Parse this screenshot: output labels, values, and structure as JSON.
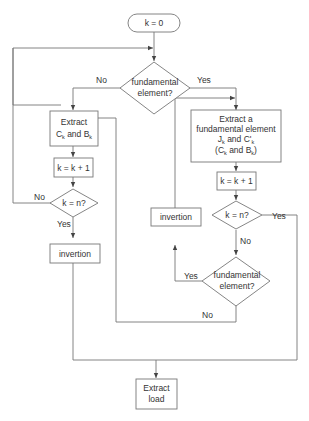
{
  "diagram": {
    "type": "flowchart",
    "nodes": {
      "start": {
        "label": "k = 0"
      },
      "decision_top": {
        "line1": "fundamental",
        "line2": "element?"
      },
      "left_extract": {
        "line1": "Extract",
        "line2_a": "C",
        "line2_a_sub": "k",
        "line2_b": " and B",
        "line2_b_sub": "k"
      },
      "left_increment": {
        "label": "k = k + 1"
      },
      "left_check": {
        "label": "k = n?"
      },
      "left_invertion": {
        "label": "invertion"
      },
      "right_extract": {
        "line1": "Extract a",
        "line2": "fundamental element",
        "line3_a": "J",
        "line3_a_sub": "k",
        "line3_b": " and C'",
        "line3_b_sub": "k",
        "line4_a": "(C",
        "line4_a_sub": "k",
        "line4_b": " and B",
        "line4_b_sub": "k",
        "line4_c": ")"
      },
      "right_increment": {
        "label": "k = k + 1"
      },
      "right_check": {
        "label": "k = n?"
      },
      "right_invertion": {
        "label": "invertion"
      },
      "decision_bottom": {
        "line1": "fundamental",
        "line2": "element?"
      },
      "end": {
        "line1": "Extract",
        "line2": "load"
      }
    },
    "edge_labels": {
      "top_no": "No",
      "top_yes": "Yes",
      "left_check_no": "No",
      "left_check_yes": "Yes",
      "right_check_yes": "Yes",
      "right_check_no": "No",
      "bottom_yes": "Yes",
      "bottom_no": "No"
    }
  }
}
